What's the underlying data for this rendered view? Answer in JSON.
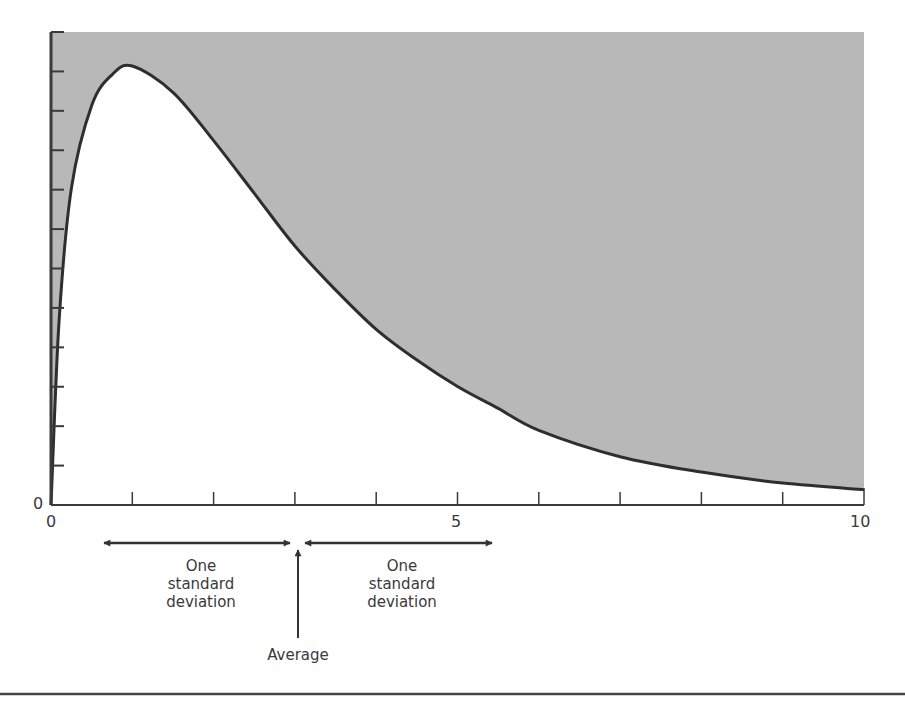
{
  "chart_data": {
    "type": "area",
    "title": "",
    "xlabel": "",
    "ylabel": "",
    "xlim": [
      0,
      10
    ],
    "ylim": [
      0,
      1
    ],
    "x_ticks": [
      0,
      1,
      2,
      3,
      4,
      5,
      6,
      7,
      8,
      9,
      10
    ],
    "x_tick_labels": [
      "0",
      "5",
      "10"
    ],
    "y_tick_labels": [
      "0"
    ],
    "y_tick_count": 13,
    "grid": false,
    "shaded_region": "above curve",
    "series": [
      {
        "name": "Skewed distribution",
        "x": [
          0,
          0.1,
          0.25,
          0.5,
          0.75,
          1.0,
          1.5,
          2.0,
          2.5,
          3.0,
          3.5,
          4.0,
          4.5,
          5.0,
          5.5,
          6.0,
          7.0,
          8.0,
          9.0,
          10.0
        ],
        "y": [
          0,
          0.42,
          0.72,
          0.91,
          0.98,
          1.0,
          0.94,
          0.83,
          0.71,
          0.59,
          0.49,
          0.4,
          0.33,
          0.27,
          0.22,
          0.17,
          0.11,
          0.075,
          0.05,
          0.035
        ]
      }
    ],
    "annotations": [
      {
        "text": "Average",
        "x": 3.05,
        "type": "up-arrow"
      },
      {
        "text": "One standard deviation",
        "from": 0.65,
        "to": 3.0,
        "type": "double-arrow"
      },
      {
        "text": "One standard deviation",
        "from": 3.1,
        "to": 5.4,
        "type": "double-arrow"
      }
    ]
  },
  "labels": {
    "y_zero": "0",
    "x_zero": "0",
    "x_five": "5",
    "x_ten": "10",
    "left_sd": [
      "One",
      "standard",
      "deviation"
    ],
    "right_sd": [
      "One",
      "standard",
      "deviation"
    ],
    "average": "Average"
  },
  "colors": {
    "shade": "#b8b8b8",
    "line": "#2e2e2e",
    "axis": "#3a3a3a"
  }
}
